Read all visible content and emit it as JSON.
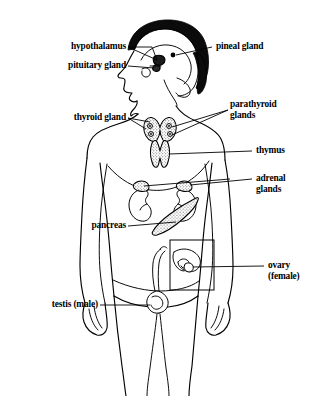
{
  "figure": {
    "background_color": "#ffffff",
    "ink_color": "#000000"
  },
  "labels": [
    {
      "id": "hypothalamus",
      "text": "hypothalamus",
      "align": "right",
      "x": 38,
      "y": 42,
      "width": 88,
      "leader": "from label right edge to brain interior"
    },
    {
      "id": "pituitary-gland",
      "text": "pituitary gland",
      "align": "right",
      "x": 30,
      "y": 61,
      "width": 96,
      "leader": "from label right edge to pituitary below hypothalamus"
    },
    {
      "id": "pineal-gland",
      "text": "pineal gland",
      "align": "left",
      "x": 216,
      "y": 42,
      "width": 80,
      "leader": "from label left edge to pineal dot in brain"
    },
    {
      "id": "thyroid-gland",
      "text": "thyroid gland",
      "align": "right",
      "x": 36,
      "y": 111,
      "width": 90,
      "leader": "from label right edge to thyroid at neck base"
    },
    {
      "id": "parathyroid-glands",
      "text": "parathyroid\nglands",
      "align": "left",
      "x": 230,
      "y": 100,
      "width": 84,
      "leader": "from label left edge to parathyroid dots on thyroid"
    },
    {
      "id": "thymus",
      "text": "thymus",
      "align": "left",
      "x": 256,
      "y": 146,
      "width": 58,
      "leader": "from label left edge to thymus in upper chest"
    },
    {
      "id": "adrenal-glands",
      "text": "adrenal\nglands",
      "align": "left",
      "x": 256,
      "y": 174,
      "width": 58,
      "leader": "from label left edge to adrenal caps atop kidneys"
    },
    {
      "id": "pancreas",
      "text": "pancreas",
      "align": "right",
      "x": 42,
      "y": 221,
      "width": 84,
      "leader": "from label right edge to pancreas between kidneys"
    },
    {
      "id": "ovary-female",
      "text": "ovary\n(female)",
      "align": "left",
      "x": 268,
      "y": 261,
      "width": 48,
      "leader": "from label left edge to ovary inside inset box"
    },
    {
      "id": "testis-male",
      "text": "testis (male)",
      "align": "right",
      "x": 14,
      "y": 300,
      "width": 84,
      "leader": "from label right edge to testis at groin"
    }
  ],
  "organs": [
    {
      "id": "brain",
      "name": "brain",
      "fill": "white outline with black hair cap"
    },
    {
      "id": "pineal-gland-organ",
      "name": "pineal gland",
      "fill": "solid black dot"
    },
    {
      "id": "hypothalamus-organ",
      "name": "hypothalamus",
      "fill": "small dark mass at brain base"
    },
    {
      "id": "pituitary-organ",
      "name": "pituitary gland",
      "fill": "small dark nub below hypothalamus"
    },
    {
      "id": "thyroid-organ",
      "name": "thyroid gland",
      "fill": "stippled butterfly"
    },
    {
      "id": "parathyroid-organ",
      "name": "parathyroid glands",
      "fill": "four small ringed dots on thyroid lobes",
      "count": 4
    },
    {
      "id": "thymus-organ",
      "name": "thymus",
      "fill": "stippled bilobed shape"
    },
    {
      "id": "adrenal-left-organ",
      "name": "left adrenal gland",
      "fill": "stippled cap on kidney"
    },
    {
      "id": "adrenal-right-organ",
      "name": "right adrenal gland",
      "fill": "stippled cap on kidney"
    },
    {
      "id": "kidney-left-organ",
      "name": "left kidney",
      "fill": "white outline bean"
    },
    {
      "id": "kidney-right-organ",
      "name": "right kidney",
      "fill": "white outline bean"
    },
    {
      "id": "pancreas-organ",
      "name": "pancreas",
      "fill": "hatched tapering wedge"
    },
    {
      "id": "ovary-organ",
      "name": "ovary and uterus",
      "fill": "white outline inside inset rectangle"
    },
    {
      "id": "testis-organ",
      "name": "testis",
      "fill": "white outline coiled oval"
    }
  ],
  "inset": {
    "id": "ovary-inset",
    "name": "female reproductive inset box",
    "x": 170,
    "y": 240,
    "width": 44,
    "height": 50
  }
}
